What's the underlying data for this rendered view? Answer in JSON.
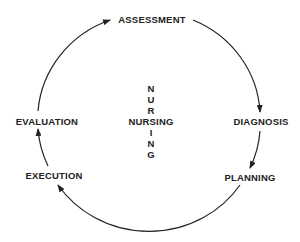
{
  "diagram": {
    "type": "cycle",
    "center": {
      "horizontal": "NURSING",
      "vertical_letters": [
        "N",
        "U",
        "R",
        "I",
        "N",
        "G"
      ]
    },
    "stages": [
      {
        "label": "ASSESSMENT"
      },
      {
        "label": "DIAGNOSIS"
      },
      {
        "label": "PLANNING"
      },
      {
        "label": "EXECUTION"
      },
      {
        "label": "EVALUATION"
      }
    ],
    "flow": [
      "ASSESSMENT",
      "DIAGNOSIS",
      "PLANNING",
      "EXECUTION",
      "EVALUATION",
      "ASSESSMENT"
    ],
    "colors": {
      "line": "#222222",
      "text": "#222222",
      "background": "#ffffff"
    }
  }
}
